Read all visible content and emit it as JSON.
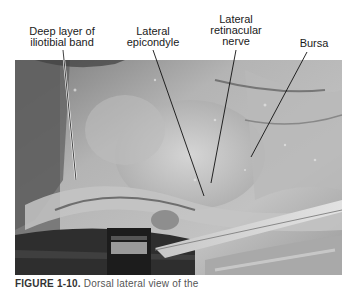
{
  "figure": {
    "labels": [
      {
        "id": "deep-layer",
        "text_line1": "Deep layer of",
        "text_line2": "iliotibial band"
      },
      {
        "id": "lateral-epicondyle",
        "text_line1": "Lateral",
        "text_line2": "epicondyle"
      },
      {
        "id": "lateral-retinacular-nerve",
        "text_line1": "Lateral",
        "text_line2": "retinacular",
        "text_line3": "nerve"
      },
      {
        "id": "bursa",
        "text_line1": "Bursa"
      }
    ],
    "caption": {
      "prefix": "FIGURE 1-10.",
      "text": "Dorsal lateral view of the"
    },
    "colors": {
      "photo_mid": "#a8a8a8",
      "photo_dark": "#2a2a2a",
      "photo_light": "#d6d6d6",
      "leader_line": "#111111"
    }
  }
}
